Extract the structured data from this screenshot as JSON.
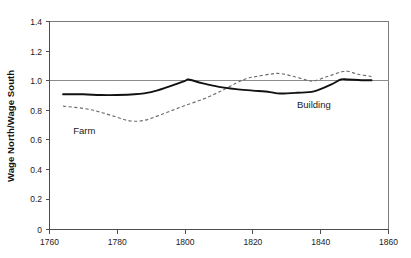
{
  "chart_data": {
    "type": "line",
    "title": "",
    "subtitle": "",
    "xlabel": "",
    "ylabel": "Wage North/Wage South",
    "xlim": [
      1760,
      1860
    ],
    "ylim": [
      0,
      1.4
    ],
    "grid": false,
    "reference_lines": [
      {
        "axis": "y",
        "value": 1.0
      }
    ],
    "legend_position": "inline-annotation",
    "xticks": [
      1760,
      1780,
      1800,
      1820,
      1840,
      1860
    ],
    "xtick_labels": [
      "1760",
      "1780",
      "1800",
      "1820",
      "1840",
      "1860"
    ],
    "yticks": [
      0,
      0.2,
      0.4,
      0.6,
      0.8,
      1.0,
      1.2,
      1.4
    ],
    "ytick_labels": [
      "0",
      "0.2",
      "0.4",
      "0.6",
      "0.8",
      "1.0",
      "1.2",
      "1.4"
    ],
    "series": [
      {
        "name": "Building",
        "style": "solid",
        "color": "#111111",
        "annotation": "Building",
        "x": [
          1764,
          1770,
          1775,
          1780,
          1785,
          1790,
          1795,
          1800,
          1801,
          1805,
          1810,
          1815,
          1820,
          1825,
          1828,
          1833,
          1838,
          1843,
          1846,
          1848,
          1852,
          1855
        ],
        "y": [
          0.91,
          0.91,
          0.905,
          0.905,
          0.91,
          0.925,
          0.96,
          1.0,
          1.01,
          0.985,
          0.96,
          0.945,
          0.935,
          0.925,
          0.915,
          0.92,
          0.93,
          0.975,
          1.01,
          1.01,
          1.005,
          1.005
        ]
      },
      {
        "name": "Farm",
        "style": "dashed",
        "color": "#6b6b6b",
        "annotation": "Farm",
        "x": [
          1764,
          1770,
          1775,
          1780,
          1784,
          1788,
          1792,
          1796,
          1800,
          1805,
          1810,
          1815,
          1818,
          1821,
          1825,
          1828,
          1832,
          1836,
          1838,
          1842,
          1846,
          1848,
          1851,
          1855
        ],
        "y": [
          0.83,
          0.815,
          0.79,
          0.755,
          0.73,
          0.735,
          0.765,
          0.8,
          0.835,
          0.875,
          0.925,
          0.985,
          1.015,
          1.03,
          1.045,
          1.05,
          1.03,
          1.005,
          1.0,
          1.03,
          1.06,
          1.065,
          1.045,
          1.03
        ]
      }
    ],
    "annotations": [
      {
        "text": "Farm",
        "x": 1767,
        "y": 0.79
      },
      {
        "text": "Building",
        "x": 1833,
        "y": 0.875
      }
    ]
  },
  "axis": {
    "y_label": "Wage North/Wage South"
  }
}
